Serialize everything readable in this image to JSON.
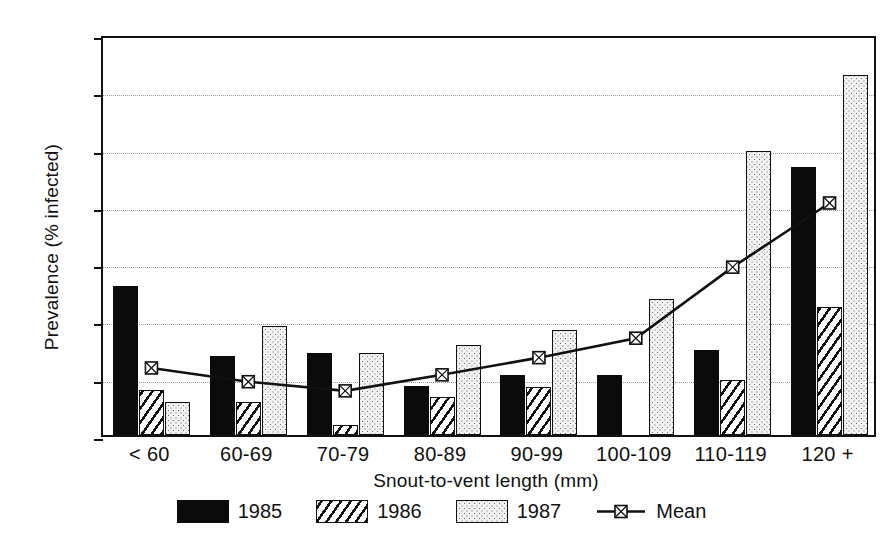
{
  "chart_data": {
    "type": "bar",
    "title": "",
    "xlabel": "Snout-to-vent length  (mm)",
    "ylabel": "Prevalence (% infected)",
    "categories": [
      "< 60",
      "60-69",
      "70-79",
      "80-89",
      "90-99",
      "100-109",
      "110-119",
      "120 +"
    ],
    "ylim": [
      0,
      35
    ],
    "yticks": [
      0,
      5,
      10,
      15,
      20,
      25,
      30,
      35
    ],
    "ytick_labels": [
      "0",
      "5",
      "10",
      "15",
      "20",
      "25",
      "30",
      "35"
    ],
    "grid": "horizontal-dotted",
    "legend_position": "bottom-center",
    "series": [
      {
        "name": "1985",
        "type": "bar",
        "fill": "solid-black",
        "values": [
          13.0,
          6.9,
          7.2,
          4.3,
          5.2,
          5.2,
          7.4,
          23.4
        ]
      },
      {
        "name": "1986",
        "type": "bar",
        "fill": "diagonal-hatch",
        "values": [
          3.9,
          2.9,
          0.9,
          3.3,
          4.2,
          0.0,
          4.8,
          11.2
        ]
      },
      {
        "name": "1987",
        "type": "bar",
        "fill": "light-stipple",
        "values": [
          2.9,
          9.5,
          7.2,
          7.9,
          9.2,
          11.9,
          24.8,
          31.4
        ]
      },
      {
        "name": "Mean",
        "type": "line",
        "marker": "square-crossed",
        "values": [
          6.2,
          5.0,
          4.2,
          5.6,
          7.1,
          8.8,
          15.0,
          20.6
        ]
      }
    ],
    "colors": {
      "axis": "#111111",
      "grid": "#9a9a9a",
      "bar_1985": "#0b0b0b",
      "bar_1986": "#ffffff",
      "bar_1987": "#f2f2f2",
      "mean_line": "#111111"
    }
  },
  "legend": {
    "items": [
      {
        "label": "1985",
        "kind": "swatch-solid"
      },
      {
        "label": "1986",
        "kind": "swatch-hatch"
      },
      {
        "label": "1987",
        "kind": "swatch-stipple"
      },
      {
        "label": "Mean",
        "kind": "line-marker"
      }
    ]
  }
}
